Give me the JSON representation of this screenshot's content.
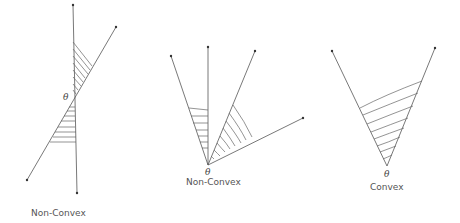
{
  "diagrams": [
    {
      "id": "left",
      "angle_label": "θ",
      "caption": "Non-Convex",
      "rays": [
        {
          "from": [
            74,
            98
          ],
          "to": [
            73,
            5
          ]
        },
        {
          "from": [
            74,
            98
          ],
          "to": [
            77,
            193
          ]
        },
        {
          "from": [
            74,
            98
          ],
          "to": [
            116,
            27
          ]
        },
        {
          "from": [
            74,
            98
          ],
          "to": [
            27,
            180
          ]
        }
      ],
      "shaded_regions": [
        "between upper vertical ray and upper-right diagonal ray",
        "between lower vertical ray and lower-left diagonal ray"
      ]
    },
    {
      "id": "middle",
      "angle_label": "θ",
      "caption": "Non-Convex",
      "rays": [
        {
          "from": [
            208,
            165
          ],
          "to": [
            171,
            56
          ]
        },
        {
          "from": [
            208,
            165
          ],
          "to": [
            208,
            47
          ]
        },
        {
          "from": [
            208,
            165
          ],
          "to": [
            255,
            51
          ]
        },
        {
          "from": [
            208,
            165
          ],
          "to": [
            303,
            118
          ]
        }
      ],
      "shaded_regions": [
        "between ray 1 and ray 2",
        "between ray 3 and ray 4"
      ]
    },
    {
      "id": "right",
      "angle_label": "θ",
      "caption": "Convex",
      "rays": [
        {
          "from": [
            387,
            166
          ],
          "to": [
            332,
            51
          ]
        },
        {
          "from": [
            387,
            166
          ],
          "to": [
            435,
            48
          ]
        }
      ],
      "shaded_regions": [
        "between the two rays"
      ]
    }
  ],
  "colors": {
    "line": "#555555",
    "hatch": "#666666",
    "text": "#555555",
    "background": "#ffffff"
  }
}
